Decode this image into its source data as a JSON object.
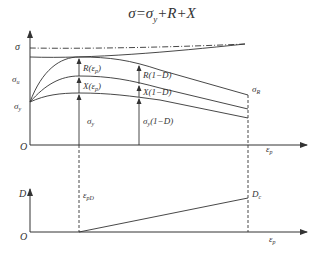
{
  "title": {
    "sigma": "σ",
    "equals": "=",
    "sigma_y_base": "σ",
    "sigma_y_sub": "y",
    "rest": "+R+X"
  },
  "upper_plot": {
    "y_axis_label": "σ",
    "origin_label": "O",
    "x_axis_label_base": "ε",
    "x_axis_label_sub": "p",
    "left_labels": {
      "sigma_u_base": "σ",
      "sigma_u_sub": "u",
      "sigma_y_base": "σ",
      "sigma_y_sub": "y"
    },
    "annotations_at_epsilon_pD": {
      "R": "R(ε",
      "R_sub": "p",
      "R_close": ")",
      "X": "X(ε",
      "X_sub": "p",
      "X_close": ")",
      "sigma_y_base": "σ",
      "sigma_y_sub": "y"
    },
    "annotations_damaged": {
      "R": "R(1−D)",
      "X": "X(1−D)",
      "sigma_base": "σ",
      "sigma_sub": "y",
      "sigma_rest": "(1−D)"
    },
    "rupture_label_base": "σ",
    "rupture_label_sub": "R"
  },
  "lower_plot": {
    "y_axis_label": "D",
    "origin_label": "O",
    "x_axis_label_base": "ε",
    "x_axis_label_sub": "p",
    "threshold_label_base": "ε",
    "threshold_label_sub": "pD",
    "critical_label_base": "D",
    "critical_label_sub": "c"
  },
  "colors": {
    "line": "#333333",
    "background": "#ffffff"
  }
}
